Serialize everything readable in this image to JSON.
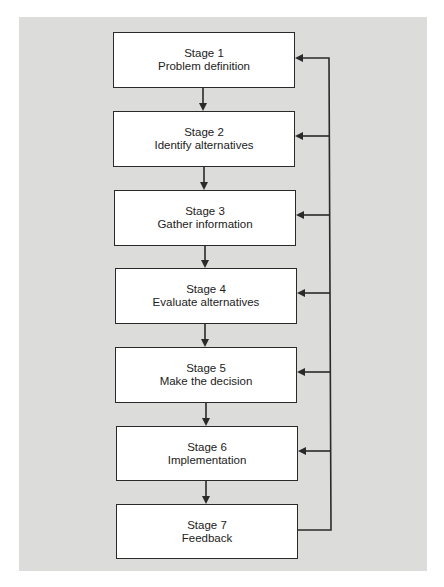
{
  "diagram": {
    "type": "flowchart",
    "direction": "top-to-bottom",
    "colors": {
      "panel_background": "#dcdcdb",
      "box_fill": "#ffffff",
      "stroke": "#2a2a2a",
      "text": "#222222"
    },
    "stages": [
      {
        "title": "Stage 1",
        "label": "Problem definition"
      },
      {
        "title": "Stage 2",
        "label": "Identify alternatives"
      },
      {
        "title": "Stage 3",
        "label": "Gather information"
      },
      {
        "title": "Stage 4",
        "label": "Evaluate alternatives"
      },
      {
        "title": "Stage 5",
        "label": "Make the decision"
      },
      {
        "title": "Stage 6",
        "label": "Implementation"
      },
      {
        "title": "Stage 7",
        "label": "Feedback"
      }
    ],
    "edges": [
      {
        "from": "Stage 1",
        "to": "Stage 2",
        "kind": "sequence"
      },
      {
        "from": "Stage 2",
        "to": "Stage 3",
        "kind": "sequence"
      },
      {
        "from": "Stage 3",
        "to": "Stage 4",
        "kind": "sequence"
      },
      {
        "from": "Stage 4",
        "to": "Stage 5",
        "kind": "sequence"
      },
      {
        "from": "Stage 5",
        "to": "Stage 6",
        "kind": "sequence"
      },
      {
        "from": "Stage 6",
        "to": "Stage 7",
        "kind": "sequence"
      },
      {
        "from": "Stage 7",
        "to": "Stage 1",
        "kind": "feedback"
      },
      {
        "from": "Stage 7",
        "to": "Stage 2",
        "kind": "feedback"
      },
      {
        "from": "Stage 7",
        "to": "Stage 3",
        "kind": "feedback"
      },
      {
        "from": "Stage 7",
        "to": "Stage 4",
        "kind": "feedback"
      },
      {
        "from": "Stage 7",
        "to": "Stage 5",
        "kind": "feedback"
      },
      {
        "from": "Stage 7",
        "to": "Stage 6",
        "kind": "feedback"
      }
    ]
  }
}
